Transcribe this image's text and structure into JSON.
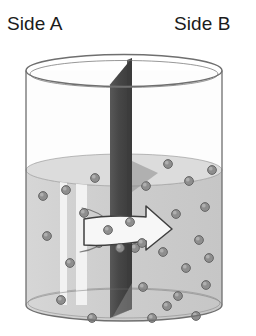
{
  "figure": {
    "title_implied": "Diffusion across a semi-permeable membrane in a beaker",
    "labels": {
      "side_a": "Side A",
      "side_b": "Side B"
    },
    "colors": {
      "text": "#1b1b1b",
      "glass_outline": "#6f6f6f",
      "liquid_fill": "#cfcfcf",
      "liquid_surface": "#dcdcdc",
      "membrane_dark": "#4a4a4a",
      "membrane_darker": "#3c3c3c",
      "particle_fill": "#8e8e8e",
      "particle_edge": "#5e5e5e",
      "arrow_fill": "#f7f7f7",
      "arrow_edge": "#3f3f3f",
      "highlight_stripe": "#f4f4f4",
      "background": "#ffffff"
    },
    "beaker": {
      "left_x": 26,
      "right_x": 222,
      "rim_top_y": 55,
      "rim_bottom_y": 86,
      "base_center_y": 305,
      "ellipse_ry": 16
    },
    "liquid": {
      "surface_center_y": 170,
      "surface_ry": 16,
      "level_label": "about half full"
    },
    "membrane": {
      "x_left": 110,
      "x_right": 132,
      "top_y": 58,
      "bottom_y": 318,
      "description": "vertical semi-permeable partition dividing Side A from Side B"
    },
    "arrow": {
      "direction": "right",
      "meaning": "net movement of particles from Side A to Side B",
      "tail_x": 84,
      "tip_x": 172,
      "center_y": 228
    },
    "particles": {
      "side_a_count": 9,
      "side_b_count": 19,
      "radius": 4.4,
      "side_a": [
        [
          47,
          236
        ],
        [
          66,
          190
        ],
        [
          70,
          263
        ],
        [
          84,
          213
        ],
        [
          61,
          300
        ],
        [
          95,
          178
        ],
        [
          99,
          243
        ],
        [
          92,
          318
        ],
        [
          43,
          196
        ]
      ],
      "side_b": [
        [
          146,
          186
        ],
        [
          168,
          164
        ],
        [
          189,
          181
        ],
        [
          205,
          207
        ],
        [
          148,
          222
        ],
        [
          176,
          214
        ],
        [
          199,
          240
        ],
        [
          163,
          252
        ],
        [
          186,
          268
        ],
        [
          206,
          285
        ],
        [
          143,
          287
        ],
        [
          167,
          306
        ],
        [
          196,
          316
        ],
        [
          152,
          318
        ],
        [
          212,
          170
        ],
        [
          135,
          248
        ],
        [
          178,
          296
        ],
        [
          209,
          258
        ],
        [
          125,
          232
        ]
      ],
      "inside_arrow": [
        [
          108,
          230
        ],
        [
          130,
          222
        ],
        [
          142,
          243
        ],
        [
          120,
          248
        ]
      ]
    },
    "highlight_stripes": [
      {
        "x": 60,
        "width": 7
      },
      {
        "x": 76,
        "width": 11
      }
    ],
    "flow_lines": {
      "count": 2,
      "description": "curved streamlines in Side A converging toward the membrane"
    }
  }
}
